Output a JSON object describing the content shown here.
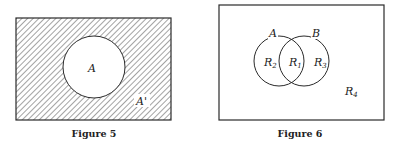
{
  "figures": [
    {
      "caption": "Figure 5",
      "set_label": "A",
      "complement_label": "A'",
      "shaded_region": "complement of A"
    },
    {
      "caption": "Figure 6",
      "set_labels": [
        "A",
        "B"
      ],
      "regions": [
        {
          "base": "R",
          "sub": "1",
          "description": "A and B"
        },
        {
          "base": "R",
          "sub": "2",
          "description": "A only"
        },
        {
          "base": "R",
          "sub": "3",
          "description": "B only"
        },
        {
          "base": "R",
          "sub": "4",
          "description": "neither A nor B"
        }
      ]
    }
  ],
  "colors": {
    "line": "#2a2a2a",
    "hatch": "#555555",
    "background": "#ffffff"
  }
}
